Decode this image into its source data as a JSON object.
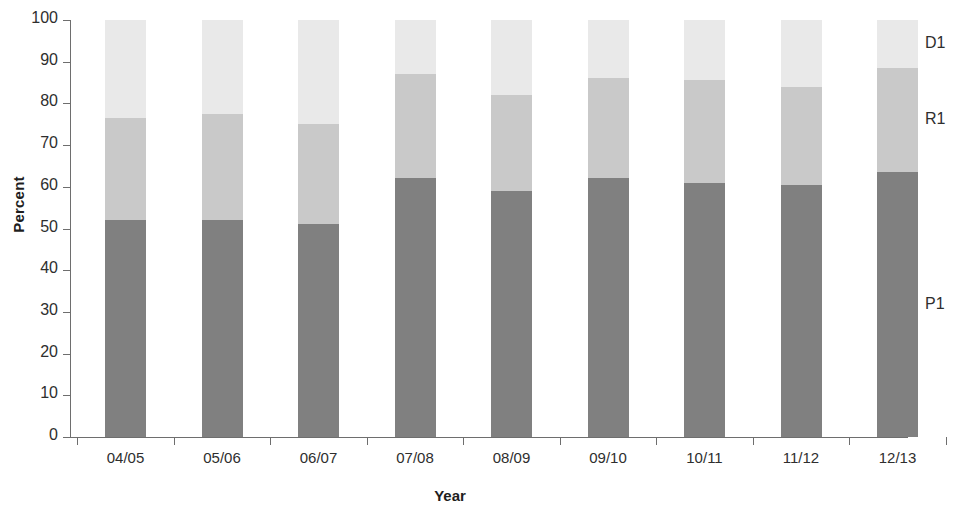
{
  "chart_data": {
    "type": "bar",
    "stacked": true,
    "title": "",
    "xlabel": "Year",
    "ylabel": "Percent",
    "ylim": [
      0,
      100
    ],
    "yticks": [
      0,
      10,
      20,
      30,
      40,
      50,
      60,
      70,
      80,
      90,
      100
    ],
    "grid": false,
    "legend_position": "right",
    "categories": [
      "04/05",
      "05/06",
      "06/07",
      "07/08",
      "08/09",
      "09/10",
      "10/11",
      "11/12",
      "12/13"
    ],
    "series": [
      {
        "name": "P1",
        "color": "#808080",
        "values": [
          52,
          52,
          51,
          62,
          59,
          62,
          61,
          60.5,
          63.5
        ]
      },
      {
        "name": "R1",
        "color": "#c9c9c9",
        "values": [
          24.5,
          25.5,
          24,
          25,
          23,
          24,
          24.5,
          23.5,
          25
        ]
      },
      {
        "name": "D1",
        "color": "#e9e9e9",
        "values": [
          23.5,
          22.5,
          25,
          13,
          18,
          14,
          14.5,
          16,
          11.5
        ]
      }
    ],
    "legend_entries": [
      {
        "label": "D1",
        "color": "#e9e9e9"
      },
      {
        "label": "R1",
        "color": "#c9c9c9"
      },
      {
        "label": "P1",
        "color": "#808080"
      }
    ]
  }
}
